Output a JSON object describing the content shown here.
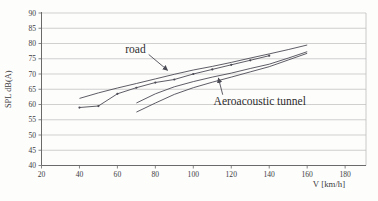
{
  "chart_data": {
    "type": "line",
    "title": "",
    "xlabel": "V [km/h]",
    "ylabel": "SPL dB(A)",
    "xlim": [
      20,
      191
    ],
    "ylim": [
      40,
      90
    ],
    "xticks": [
      20,
      40,
      60,
      80,
      100,
      120,
      140,
      160,
      180
    ],
    "yticks": [
      40,
      45,
      50,
      55,
      60,
      65,
      70,
      75,
      80,
      85,
      90
    ],
    "grid": "horizontal-only",
    "legend": "none (annotated with arrows)",
    "line_color": "#4b4b55",
    "grid_color": "#bcbcbc",
    "axis_color": "#6a6a6a",
    "text_color": "#3c3c3c",
    "series": [
      {
        "name": "road (upper run)",
        "x": [
          40,
          50,
          60,
          70,
          80,
          90,
          100,
          110,
          120,
          130,
          140,
          150,
          160
        ],
        "y": [
          62,
          63.8,
          65.4,
          66.9,
          68.4,
          69.9,
          71.3,
          72.5,
          73.8,
          75.2,
          76.6,
          78,
          79.5
        ],
        "markers": false
      },
      {
        "name": "road (lower run)",
        "x": [
          40,
          50,
          60,
          70,
          80,
          90,
          100,
          110,
          120,
          130,
          140
        ],
        "y": [
          59,
          59.5,
          63.5,
          65.5,
          67.2,
          68.2,
          70,
          71.5,
          73,
          74.5,
          76
        ],
        "markers": true
      },
      {
        "name": "aeroacoustic tunnel (upper run)",
        "x": [
          70,
          80,
          90,
          100,
          110,
          120,
          130,
          140,
          150,
          160
        ],
        "y": [
          60.5,
          63.5,
          65.8,
          67.5,
          69,
          70.3,
          71.8,
          73.2,
          75.2,
          77.3
        ],
        "markers": false
      },
      {
        "name": "aeroacoustic tunnel (lower run)",
        "x": [
          70,
          80,
          90,
          100,
          110,
          120,
          130,
          140,
          150,
          160
        ],
        "y": [
          57.5,
          60.5,
          63.3,
          65.5,
          67.3,
          69,
          70.7,
          72.4,
          74.6,
          76.8
        ],
        "markers": false
      }
    ],
    "annotations": [
      {
        "text": "road",
        "text_x": 69.5,
        "text_y": 78.2,
        "font_px": 11.5,
        "arrow_from_x": 76.5,
        "arrow_from_y": 76.4,
        "arrow_to_x": 86.5,
        "arrow_to_y": 71.2
      },
      {
        "text": "Aeroacoustic tunnel",
        "text_x": 135,
        "text_y": 61.2,
        "font_px": 11.5,
        "arrow_from_x": 115.5,
        "arrow_from_y": 63.2,
        "arrow_to_x": 113.2,
        "arrow_to_y": 68.7
      }
    ]
  },
  "layout": {
    "plot_left": 41.5,
    "plot_right": 366,
    "plot_top": 13,
    "plot_bottom": 165.5
  }
}
